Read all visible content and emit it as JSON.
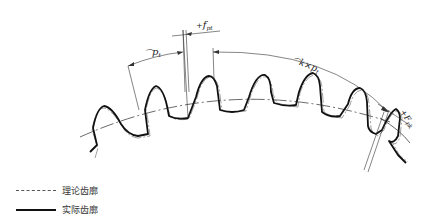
{
  "diagram": {
    "title": "",
    "annotations": {
      "pitch": {
        "prefix": "⌒",
        "symbol": "p",
        "subscript": "t"
      },
      "single_pitch_deviation": {
        "prefix": "+",
        "symbol": "f",
        "subscript": "pt"
      },
      "k_pitch": {
        "prefix": "⌒",
        "text": "k×",
        "symbol": "p",
        "subscript": "t"
      },
      "cumulative_pitch_deviation": {
        "prefix": "+",
        "symbol": "F",
        "subscript": "pk"
      }
    },
    "legend": [
      {
        "label": "理论齿廓",
        "style": "dash-dot-thin"
      },
      {
        "label": "实际齿廓",
        "style": "solid-thick"
      }
    ]
  }
}
